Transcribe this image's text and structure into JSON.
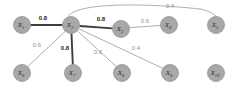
{
  "figure": {
    "type": "node-link-graph",
    "width": 238,
    "height": 91,
    "background": "#ffffff",
    "node_fill": "#a8a8a8",
    "strong_edge_color": "#3d3d3d",
    "weak_edge_color": "#9a9a9a"
  },
  "nodes": [
    {
      "id": "x1",
      "label": "X",
      "sub": "1",
      "cx": 22,
      "cy": 25,
      "r": 8.5
    },
    {
      "id": "x2",
      "label": "X",
      "sub": "2",
      "cx": 71,
      "cy": 25,
      "r": 8.5
    },
    {
      "id": "x3",
      "label": "X",
      "sub": "3",
      "cx": 121,
      "cy": 29,
      "r": 8.5
    },
    {
      "id": "x4",
      "label": "X",
      "sub": "4",
      "cx": 169,
      "cy": 25,
      "r": 8.5
    },
    {
      "id": "x5",
      "label": "X",
      "sub": "5",
      "cx": 216,
      "cy": 25,
      "r": 8.5
    },
    {
      "id": "x6",
      "label": "X",
      "sub": "6",
      "cx": 22,
      "cy": 73,
      "r": 8.5
    },
    {
      "id": "x7",
      "label": "X",
      "sub": "7",
      "cx": 73,
      "cy": 73,
      "r": 8.5
    },
    {
      "id": "x8",
      "label": "X",
      "sub": "8",
      "cx": 122,
      "cy": 73,
      "r": 8.5
    },
    {
      "id": "x9",
      "label": "X",
      "sub": "9",
      "cx": 170,
      "cy": 73,
      "r": 8.5
    },
    {
      "id": "x10",
      "label": "X",
      "sub": "10",
      "cx": 216,
      "cy": 73,
      "r": 8.5
    }
  ],
  "edges": [
    {
      "id": "e-x1-x2",
      "source": "x1",
      "target": "x2",
      "weight": "0.8",
      "strong": true,
      "label_x": 43,
      "label_y": 18,
      "path": "M 30.5 25 L 62.5 25"
    },
    {
      "id": "e-x2-x3",
      "source": "x2",
      "target": "x3",
      "weight": "0.8",
      "strong": true,
      "label_x": 101,
      "label_y": 19,
      "path": "M 79.5 26 L 112.6 28.4"
    },
    {
      "id": "e-x3-x4",
      "source": "x3",
      "target": "x4",
      "weight": "0.6",
      "strong": false,
      "label_x": 145,
      "label_y": 21,
      "path": "M 129.4 27.6 L 160.6 25.4"
    },
    {
      "id": "e-x2-x5",
      "source": "x2",
      "target": "x5",
      "weight": "0.4",
      "strong": false,
      "label_x": 170,
      "label_y": 6,
      "path": "M 68 16.6 C 76 3, 140 2.5, 200 9 C 208 10.5, 214 14, 216.5 16.5"
    },
    {
      "id": "e-x2-x6",
      "source": "x2",
      "target": "x6",
      "weight": "0.6",
      "strong": false,
      "label_x": 37,
      "label_y": 45,
      "path": "M 65.2 31.5 L 27.7 66.6"
    },
    {
      "id": "e-x2-x7",
      "source": "x2",
      "target": "x7",
      "weight": "0.8",
      "strong": true,
      "label_x": 65,
      "label_y": 48,
      "path": "M 71.5 33.5 L 72.8 64.5"
    },
    {
      "id": "e-x2-x8",
      "source": "x2",
      "target": "x8",
      "weight": "0.6",
      "strong": false,
      "label_x": 98,
      "label_y": 52,
      "path": "M 77.6 31 L 116.4 66.7"
    },
    {
      "id": "e-x2-x9",
      "source": "x2",
      "target": "x9",
      "weight": "0.4",
      "strong": false,
      "label_x": 136,
      "label_y": 48,
      "path": "M 79.2 29 L 162.5 68.2"
    }
  ],
  "isolated_nodes": [
    "x10"
  ]
}
